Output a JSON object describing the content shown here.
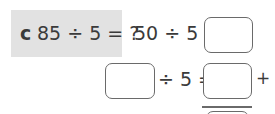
{
  "question": {
    "label": "c",
    "expression": "85 ÷ 5 = ?"
  },
  "line1": {
    "expression": "50 ÷ 5 =",
    "answer": ""
  },
  "line2": {
    "dividend": "",
    "operator_text": "÷ 5 =",
    "answer": "",
    "plus": "+"
  },
  "colors": {
    "question_bg": "#e2e2e2",
    "text": "#3a3a3a",
    "box_border": "#6a6a6a"
  }
}
